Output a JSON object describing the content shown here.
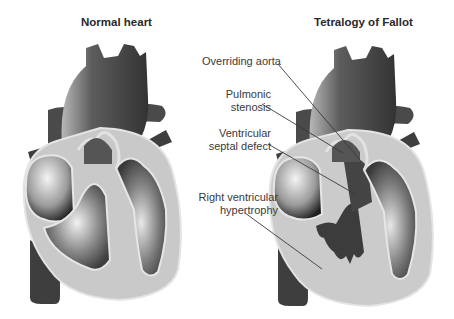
{
  "figure": {
    "panels": [
      {
        "id": "normal",
        "title": "Normal heart"
      },
      {
        "id": "tof",
        "title": "Tetralogy of Fallot"
      }
    ],
    "annotations": [
      {
        "id": "overriding-aorta",
        "line1": "Overriding aorta",
        "line2": ""
      },
      {
        "id": "pulmonic-stenosis",
        "line1": "Pulmonic",
        "line2": "stenosis"
      },
      {
        "id": "vsd",
        "line1": "Ventricular",
        "line2": "septal defect"
      },
      {
        "id": "rvh",
        "line1": "Right ventricular",
        "line2": "hypertrophy"
      }
    ],
    "colors": {
      "vessel_dark": "#3c3c3c",
      "vessel_mid": "#5a5a5a",
      "wall_light": "#c8c8c8",
      "outline": "#e6e6e6",
      "chamber_glow": "#f0f0f0",
      "text": "#333333"
    }
  }
}
